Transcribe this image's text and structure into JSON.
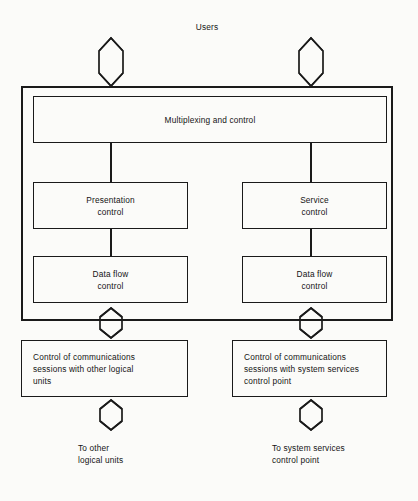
{
  "diagram": {
    "title_label": "Users",
    "outer_unit": {
      "name": "logical-unit-boundary"
    },
    "boxes": [
      {
        "id": "multiplexing-and-control",
        "label": "Multiplexing and control"
      },
      {
        "id": "presentation-control",
        "label": "Presentation\ncontrol"
      },
      {
        "id": "service-control",
        "label": "Service\ncontrol"
      },
      {
        "id": "data-flow-control-left",
        "label": "Data flow\ncontrol"
      },
      {
        "id": "data-flow-control-right",
        "label": "Data flow\ncontrol"
      },
      {
        "id": "control-of-sessions-other-logical-units",
        "label": "Control of communications\nsessions with other logical\nunits"
      },
      {
        "id": "control-of-sessions-system-services-control-point",
        "label": "Control of communications\nsessions with system services\ncontrol point"
      }
    ],
    "footers": [
      {
        "id": "to-other-logical-units",
        "label": "To other\nlogical units"
      },
      {
        "id": "to-system-services-control-point",
        "label": "To system services\ncontrol point"
      }
    ],
    "arrows": [
      {
        "id": "users-to-multiplexing-left",
        "direction": "bidirectional"
      },
      {
        "id": "users-to-multiplexing-right",
        "direction": "bidirectional"
      },
      {
        "id": "data-flow-left-to-sessions-left",
        "direction": "bidirectional"
      },
      {
        "id": "data-flow-right-to-sessions-right",
        "direction": "bidirectional"
      },
      {
        "id": "sessions-left-to-other-logical-units",
        "direction": "bidirectional"
      },
      {
        "id": "sessions-right-to-sscp",
        "direction": "bidirectional"
      }
    ],
    "connectors": [
      {
        "id": "multiplexing-to-presentation"
      },
      {
        "id": "multiplexing-to-service"
      },
      {
        "id": "presentation-to-data-flow-left"
      },
      {
        "id": "service-to-data-flow-right"
      }
    ],
    "colors": {
      "ink": "#1a1a1a",
      "paper": "#fbfbf9"
    }
  }
}
